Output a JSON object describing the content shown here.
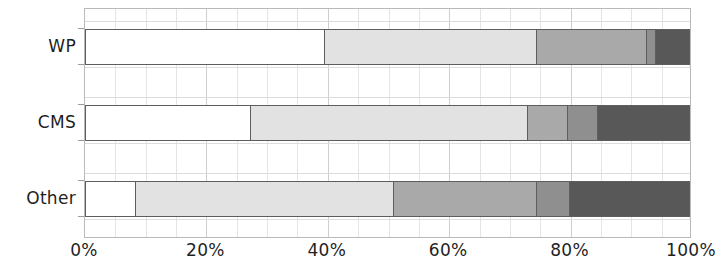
{
  "chart_data": {
    "type": "bar",
    "orientation": "horizontal",
    "stacked": true,
    "normalized": true,
    "title": "",
    "subtitle": "",
    "xlabel": "",
    "ylabel": "",
    "xlim": [
      0,
      100
    ],
    "grid": true,
    "legend": null,
    "legend_position": "none",
    "categories": [
      "WP",
      "CMS",
      "Other"
    ],
    "xtick_labels": [
      "0%",
      "20%",
      "40%",
      "60%",
      "80%",
      "100%"
    ],
    "xtick_values": [
      0,
      20,
      40,
      60,
      80,
      100
    ],
    "series": [
      {
        "name": "Segment 1",
        "color": "#ffffff",
        "values": [
          39.5,
          27.2,
          8.2
        ]
      },
      {
        "name": "Segment 2",
        "color": "#e2e2e2",
        "values": [
          35.1,
          45.9,
          42.7
        ]
      },
      {
        "name": "Segment 3",
        "color": "#a9a9a9",
        "values": [
          18.1,
          6.6,
          23.7
        ]
      },
      {
        "name": "Segment 4",
        "color": "#8f8f8f",
        "values": [
          1.5,
          5.0,
          5.4
        ]
      },
      {
        "name": "Segment 5",
        "color": "#585858",
        "values": [
          5.8,
          15.3,
          20.0
        ]
      }
    ],
    "bars": [
      {
        "category": "WP",
        "segments": [
          {
            "value": 39.5,
            "cumulative": 39.5,
            "color": "#ffffff"
          },
          {
            "value": 35.1,
            "cumulative": 74.6,
            "color": "#e2e2e2"
          },
          {
            "value": 18.1,
            "cumulative": 92.7,
            "color": "#a9a9a9"
          },
          {
            "value": 1.5,
            "cumulative": 94.2,
            "color": "#8f8f8f"
          },
          {
            "value": 5.8,
            "cumulative": 100.0,
            "color": "#585858"
          }
        ]
      },
      {
        "category": "CMS",
        "segments": [
          {
            "value": 27.2,
            "cumulative": 27.2,
            "color": "#ffffff"
          },
          {
            "value": 45.9,
            "cumulative": 73.1,
            "color": "#e2e2e2"
          },
          {
            "value": 6.6,
            "cumulative": 79.7,
            "color": "#a9a9a9"
          },
          {
            "value": 5.0,
            "cumulative": 84.7,
            "color": "#8f8f8f"
          },
          {
            "value": 15.3,
            "cumulative": 100.0,
            "color": "#585858"
          }
        ]
      },
      {
        "category": "Other",
        "segments": [
          {
            "value": 8.2,
            "cumulative": 8.2,
            "color": "#ffffff"
          },
          {
            "value": 42.7,
            "cumulative": 50.9,
            "color": "#e2e2e2"
          },
          {
            "value": 23.7,
            "cumulative": 74.6,
            "color": "#a9a9a9"
          },
          {
            "value": 5.4,
            "cumulative": 80.0,
            "color": "#8f8f8f"
          },
          {
            "value": 20.0,
            "cumulative": 100.0,
            "color": "#585858"
          }
        ]
      }
    ],
    "style": {
      "plot_border_color": "#b9b9b9",
      "gridline_color": "#d8d8d8",
      "bar_outline_color": "#5e5e5e",
      "background": "#ffffff",
      "text_color": "#1f1f1f"
    }
  }
}
